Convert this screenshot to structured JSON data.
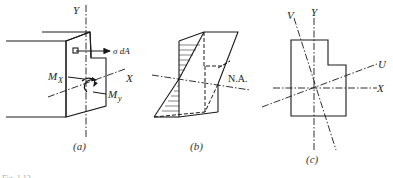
{
  "figure": {
    "caption_fragment": "Fig. 1.13",
    "panels": [
      {
        "id": "a",
        "caption": "(a)",
        "labels": {
          "axis_y": "Y",
          "axis_x": "X",
          "stress_force": "σ dA",
          "moment_x_base": "M",
          "moment_x_sub": "X",
          "moment_y_base": "M",
          "moment_y_sub": "y"
        }
      },
      {
        "id": "b",
        "caption": "(b)",
        "labels": {
          "neutral_axis": "N.A."
        }
      },
      {
        "id": "c",
        "caption": "(c)",
        "labels": {
          "axis_v": "V",
          "axis_y": "Y",
          "axis_u": "U",
          "axis_x": "X"
        }
      }
    ]
  }
}
